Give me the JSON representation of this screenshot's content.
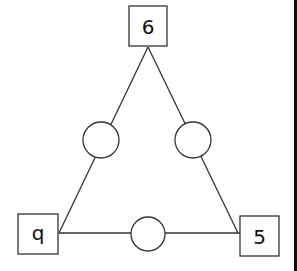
{
  "diagram": {
    "type": "number-triangle",
    "stroke_color": "#333333",
    "border_color": "#111111",
    "vertices": [
      {
        "position": "top",
        "label": "6"
      },
      {
        "position": "bottom-left",
        "label": "q"
      },
      {
        "position": "bottom-right",
        "label": "5"
      }
    ],
    "edge_circles": [
      {
        "position": "left-edge",
        "label": ""
      },
      {
        "position": "right-edge",
        "label": ""
      },
      {
        "position": "bottom-edge",
        "label": ""
      }
    ]
  }
}
